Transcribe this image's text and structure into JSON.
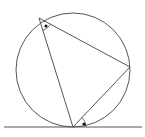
{
  "diagram": {
    "stroke_color": "#555555",
    "background": "#ffffff",
    "circle": {
      "cx": 73,
      "cy": 70,
      "r": 57
    },
    "tangent_line": {
      "x1": 4,
      "y1": 127,
      "x2": 142,
      "y2": 127
    },
    "points": {
      "A": {
        "x": 39,
        "y": 18
      },
      "B": {
        "x": 130,
        "y": 67
      },
      "C": {
        "x": 73,
        "y": 127
      }
    },
    "angle_marks": [
      {
        "at": "A",
        "label": "inscribed-angle",
        "dot": {
          "x": 46,
          "y": 26
        }
      },
      {
        "at": "C",
        "label": "tangent-chord-angle",
        "dot": {
          "x": 84,
          "y": 124
        }
      }
    ]
  }
}
